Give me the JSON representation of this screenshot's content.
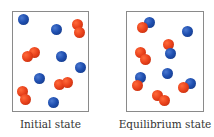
{
  "panels": [
    {
      "label": "Initial state",
      "box": {
        "x": 12,
        "y": 11,
        "w": 77,
        "h": 101
      },
      "particles": [
        {
          "c": "blue",
          "x": 23,
          "y": 19
        },
        {
          "c": "blue",
          "x": 56,
          "y": 29
        },
        {
          "c": "red",
          "x": 77,
          "y": 24
        },
        {
          "c": "red",
          "x": 79,
          "y": 32
        },
        {
          "c": "red",
          "x": 34,
          "y": 52
        },
        {
          "c": "red",
          "x": 27,
          "y": 56
        },
        {
          "c": "blue",
          "x": 61,
          "y": 56
        },
        {
          "c": "blue",
          "x": 80,
          "y": 67
        },
        {
          "c": "blue",
          "x": 39,
          "y": 78
        },
        {
          "c": "red",
          "x": 59,
          "y": 84
        },
        {
          "c": "red",
          "x": 67,
          "y": 82
        },
        {
          "c": "red",
          "x": 22,
          "y": 91
        },
        {
          "c": "red",
          "x": 25,
          "y": 99
        },
        {
          "c": "blue",
          "x": 53,
          "y": 102
        }
      ]
    },
    {
      "label": "Equilibrium state",
      "box": {
        "x": 126,
        "y": 11,
        "w": 78,
        "h": 101
      },
      "particles": [
        {
          "c": "blue",
          "x": 149,
          "y": 22
        },
        {
          "c": "red",
          "x": 142,
          "y": 27
        },
        {
          "c": "blue",
          "x": 187,
          "y": 31
        },
        {
          "c": "red",
          "x": 168,
          "y": 44
        },
        {
          "c": "blue",
          "x": 170,
          "y": 53
        },
        {
          "c": "red",
          "x": 140,
          "y": 52
        },
        {
          "c": "red",
          "x": 145,
          "y": 59
        },
        {
          "c": "blue",
          "x": 167,
          "y": 73
        },
        {
          "c": "blue",
          "x": 140,
          "y": 77
        },
        {
          "c": "red",
          "x": 137,
          "y": 85
        },
        {
          "c": "blue",
          "x": 190,
          "y": 83
        },
        {
          "c": "red",
          "x": 183,
          "y": 87
        },
        {
          "c": "red",
          "x": 157,
          "y": 95
        },
        {
          "c": "red",
          "x": 164,
          "y": 100
        }
      ]
    }
  ],
  "colors": {
    "blue": "#1f4fb0",
    "red": "#e8401a",
    "border": "#8a8a8a",
    "text": "#333333"
  }
}
